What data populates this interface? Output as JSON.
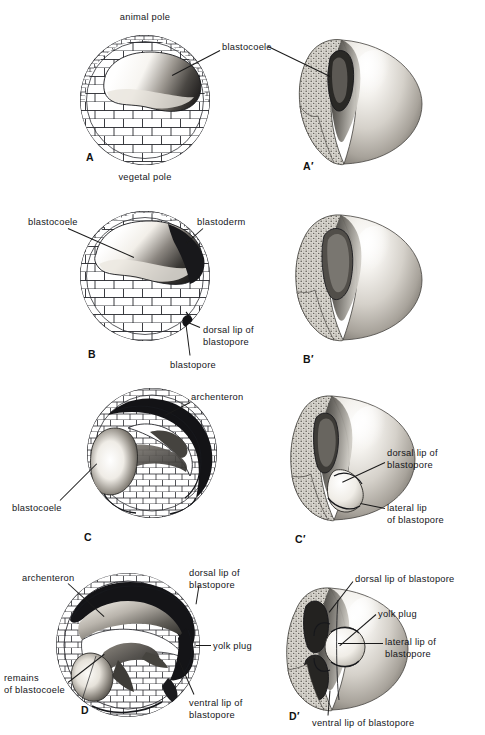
{
  "figure": {
    "background": "#ffffff",
    "ink": "#16171b"
  },
  "panels": [
    {
      "id": "A",
      "id_label": "A",
      "kind": "section",
      "cx": 145,
      "cy": 100,
      "r": 66,
      "id_x": 86,
      "id_y": 151,
      "labels": [
        {
          "name": "animal-pole",
          "text": "animal pole",
          "x": 145,
          "y": 12,
          "align": "ctr"
        },
        {
          "name": "vegetal-pole",
          "text": "vegetal pole",
          "x": 145,
          "y": 172,
          "align": "ctr"
        },
        {
          "name": "blastocoele",
          "text": "blastocoele",
          "x": 222,
          "y": 42,
          "align": "left"
        }
      ],
      "leaders": [
        {
          "name": "blastocoele-leader",
          "x1": 220,
          "y1": 50,
          "x2": 172,
          "y2": 75
        }
      ]
    },
    {
      "id": "A'",
      "id_label": "A′",
      "kind": "solid",
      "cx": 360,
      "cy": 100,
      "r": 62,
      "id_x": 303,
      "id_y": 160,
      "labels": [],
      "leaders": [
        {
          "name": "blastocoele-leader-3d",
          "x1": 268,
          "y1": 46,
          "x2": 330,
          "y2": 76
        }
      ]
    },
    {
      "id": "B",
      "id_label": "B",
      "kind": "section",
      "cx": 145,
      "cy": 276,
      "r": 66,
      "id_x": 88,
      "id_y": 348,
      "labels": [
        {
          "name": "blastocoele",
          "text": "blastocoele",
          "x": 28,
          "y": 217,
          "align": "left"
        },
        {
          "name": "blastoderm",
          "text": "blastoderm",
          "x": 197,
          "y": 217,
          "align": "left"
        },
        {
          "name": "dorsal-lip-of-blastopore",
          "text": "dorsal lip of\nblastopore",
          "x": 203,
          "y": 325,
          "align": "left"
        },
        {
          "name": "blastopore",
          "text": "blastopore",
          "x": 170,
          "y": 360,
          "align": "left"
        }
      ],
      "leaders": [
        {
          "name": "blastocoele-leader",
          "x1": 68,
          "y1": 228,
          "x2": 134,
          "y2": 257
        },
        {
          "name": "blastoderm-leader",
          "x1": 203,
          "y1": 228,
          "x2": 186,
          "y2": 243
        },
        {
          "name": "dorsal-lip-leader",
          "x1": 200,
          "y1": 327,
          "x2": 188,
          "y2": 322
        },
        {
          "name": "blastopore-leader",
          "x1": 190,
          "y1": 355,
          "x2": 186,
          "y2": 324
        }
      ]
    },
    {
      "id": "B'",
      "id_label": "B′",
      "kind": "solid",
      "cx": 360,
      "cy": 276,
      "r": 62,
      "id_x": 303,
      "id_y": 353,
      "labels": [],
      "leaders": []
    },
    {
      "id": "C",
      "id_label": "C",
      "kind": "section",
      "cx": 152,
      "cy": 453,
      "r": 66,
      "id_x": 84,
      "id_y": 531,
      "labels": [
        {
          "name": "archenteron",
          "text": "archenteron",
          "x": 191,
          "y": 392,
          "align": "left"
        },
        {
          "name": "blastocoele",
          "text": "blastocoele",
          "x": 12,
          "y": 503,
          "align": "left"
        }
      ],
      "leaders": [
        {
          "name": "archenteron-leader",
          "x1": 190,
          "y1": 402,
          "x2": 165,
          "y2": 415
        },
        {
          "name": "blastocoele-leader",
          "x1": 60,
          "y1": 500,
          "x2": 97,
          "y2": 463
        }
      ]
    },
    {
      "id": "C'",
      "id_label": "C′",
      "kind": "solid",
      "cx": 352,
      "cy": 457,
      "r": 63,
      "id_x": 295,
      "id_y": 533,
      "labels": [
        {
          "name": "dorsal-lip-of-blastopore",
          "text": "dorsal lip of\nblastopore",
          "x": 387,
          "y": 448,
          "align": "left"
        },
        {
          "name": "lateral-lip-of-blastopore",
          "text": "lateral lip\nof blastopore",
          "x": 387,
          "y": 503,
          "align": "left"
        }
      ],
      "leaders": [
        {
          "name": "dorsal-lip-leader",
          "x1": 385,
          "y1": 462,
          "x2": 342,
          "y2": 482
        },
        {
          "name": "lateral-lip-leader",
          "x1": 385,
          "y1": 508,
          "x2": 360,
          "y2": 503
        }
      ]
    },
    {
      "id": "D",
      "id_label": "D",
      "kind": "section",
      "cx": 128,
      "cy": 645,
      "r": 73,
      "id_x": 81,
      "id_y": 704,
      "labels": [
        {
          "name": "archenteron",
          "text": "archenteron",
          "x": 22,
          "y": 573,
          "align": "left"
        },
        {
          "name": "dorsal-lip-of-blastopore",
          "text": "dorsal lip of\nblastopore",
          "x": 189,
          "y": 568,
          "align": "left"
        },
        {
          "name": "yolk-plug",
          "text": "yolk plug",
          "x": 213,
          "y": 641,
          "align": "left"
        },
        {
          "name": "remains-of-blastocoele",
          "text": "remains\nof blastocoele",
          "x": 4,
          "y": 673,
          "align": "left"
        },
        {
          "name": "ventral-lip-of-blastopore",
          "text": "ventral lip of\nblastopore",
          "x": 189,
          "y": 698,
          "align": "left"
        }
      ],
      "leaders": [
        {
          "name": "archenteron-leader",
          "x1": 68,
          "y1": 583,
          "x2": 104,
          "y2": 616
        },
        {
          "name": "dorsal-lip-leader",
          "x1": 199,
          "y1": 585,
          "x2": 196,
          "y2": 604
        },
        {
          "name": "yolk-plug-leader",
          "x1": 211,
          "y1": 645,
          "x2": 196,
          "y2": 645
        },
        {
          "name": "remains-leader",
          "x1": 68,
          "y1": 682,
          "x2": 104,
          "y2": 654
        },
        {
          "name": "ventral-lip-leader",
          "x1": 194,
          "y1": 694,
          "x2": 178,
          "y2": 658
        }
      ]
    },
    {
      "id": "D'",
      "id_label": "D′",
      "kind": "solid",
      "cx": 345,
      "cy": 648,
      "r": 63,
      "id_x": 289,
      "id_y": 710,
      "labels": [
        {
          "name": "dorsal-lip-of-blastopore",
          "text": "dorsal lip of blastopore",
          "x": 355,
          "y": 574,
          "align": "left"
        },
        {
          "name": "yolk-plug",
          "text": "yolk plug",
          "x": 378,
          "y": 609,
          "align": "left"
        },
        {
          "name": "lateral-lip-of-blastopore",
          "text": "lateral lip of\nblastopore",
          "x": 385,
          "y": 637,
          "align": "left"
        },
        {
          "name": "ventral-lip-of-blastopore",
          "text": "ventral lip of blastopore",
          "x": 312,
          "y": 718,
          "align": "left"
        }
      ],
      "leaders": [
        {
          "name": "dorsal-lip-leader",
          "x1": 353,
          "y1": 581,
          "x2": 329,
          "y2": 612
        },
        {
          "name": "yolk-plug-leader",
          "x1": 376,
          "y1": 614,
          "x2": 340,
          "y2": 645
        },
        {
          "name": "lateral-lip-leader",
          "x1": 383,
          "y1": 643,
          "x2": 338,
          "y2": 643
        },
        {
          "name": "ventral-lip-leader",
          "x1": 328,
          "y1": 715,
          "x2": 330,
          "y2": 690
        }
      ]
    }
  ]
}
